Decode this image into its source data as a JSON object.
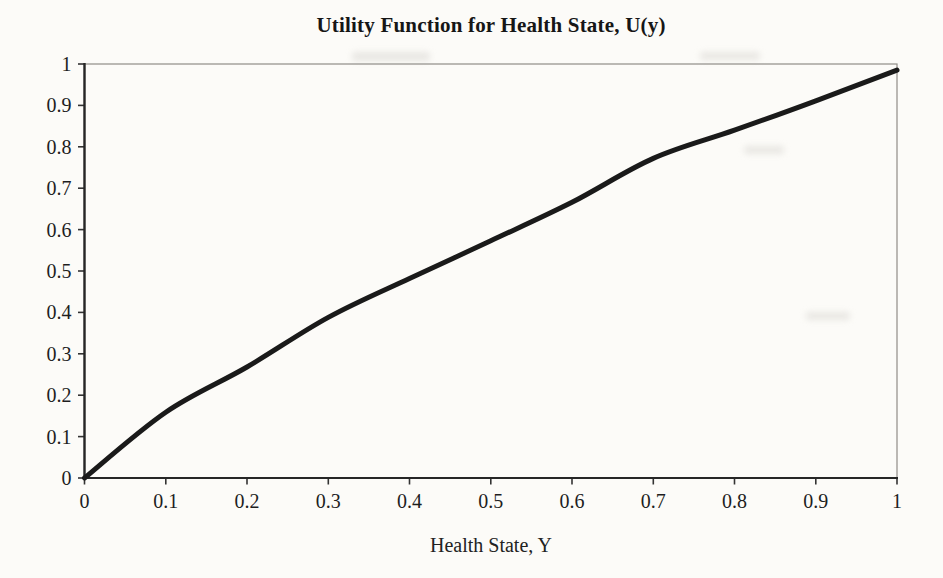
{
  "figure": {
    "kind": "scanned-statistical-figure",
    "background": "#fcfbf8"
  },
  "chart": {
    "title": "Utility Function for Health State, U(y)",
    "x_axis_label": "Health State, Y"
  },
  "chart_data": {
    "type": "line",
    "title": "Utility Function for Health State, U(y)",
    "xlabel": "Health State, Y",
    "ylabel": "",
    "x": [
      0,
      0.1,
      0.2,
      0.3,
      0.4,
      0.5,
      0.6,
      0.7,
      0.8,
      0.9,
      1.0
    ],
    "series": [
      {
        "name": "U(y)",
        "values": [
          0,
          0.159,
          0.268,
          0.388,
          0.482,
          0.573,
          0.666,
          0.772,
          0.84,
          0.911,
          0.985
        ]
      }
    ],
    "approx_function": "U(y) ~ y^0.8 (concave utility curve)",
    "x_ticks": [
      "0",
      "0.1",
      "0.2",
      "0.3",
      "0.4",
      "0.5",
      "0.6",
      "0.7",
      "0.8",
      "0.9",
      "1"
    ],
    "y_ticks": [
      "0",
      "0.1",
      "0.2",
      "0.3",
      "0.4",
      "0.5",
      "0.6",
      "0.7",
      "0.8",
      "0.9",
      "1"
    ],
    "xlim": [
      0,
      1
    ],
    "ylim": [
      0,
      1
    ],
    "grid": false,
    "legend": "none",
    "colors": {
      "line": "#1a1a1a",
      "axis": "#262626",
      "plot_border": "#8f8d88",
      "tick": "#333333",
      "text": "#1e1e1e"
    },
    "line_width": 5
  }
}
